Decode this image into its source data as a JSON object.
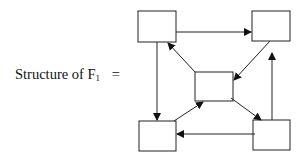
{
  "label": {
    "prefix": "Structure of F",
    "subscript": "1",
    "equals": "="
  },
  "diagram": {
    "nodes": [
      {
        "id": "top-left",
        "x": 138,
        "y": 11,
        "w": 38,
        "h": 31
      },
      {
        "id": "top-right",
        "x": 252,
        "y": 11,
        "w": 38,
        "h": 30
      },
      {
        "id": "center",
        "x": 195,
        "y": 72,
        "w": 38,
        "h": 29
      },
      {
        "id": "bottom-left",
        "x": 139,
        "y": 121,
        "w": 37,
        "h": 30
      },
      {
        "id": "bottom-right",
        "x": 253,
        "y": 120,
        "w": 37,
        "h": 30
      }
    ],
    "edges": [
      {
        "from": "top-left",
        "to": "top-right"
      },
      {
        "from": "top-left",
        "to": "bottom-left"
      },
      {
        "from": "top-right",
        "to": "center"
      },
      {
        "from": "center",
        "to": "top-left"
      },
      {
        "from": "center",
        "to": "bottom-right"
      },
      {
        "from": "bottom-left",
        "to": "center"
      },
      {
        "from": "bottom-right",
        "to": "bottom-left"
      },
      {
        "from": "bottom-right",
        "to": "top-right"
      }
    ]
  }
}
